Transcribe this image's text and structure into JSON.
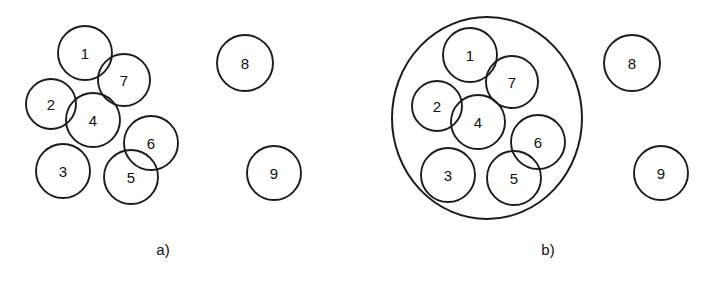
{
  "figure": {
    "width": 719,
    "height": 288,
    "background": "#ffffff",
    "stroke_color": "#1c1c1c",
    "label_color": "#111111"
  },
  "panels": [
    {
      "id": "panel-a",
      "caption": "a)",
      "caption_x": 163,
      "caption_y": 255,
      "hull": null,
      "circles": [
        {
          "label": "1",
          "cx": 85,
          "cy": 53,
          "r": 27
        },
        {
          "label": "7",
          "cx": 124,
          "cy": 80,
          "r": 26
        },
        {
          "label": "2",
          "cx": 51,
          "cy": 104,
          "r": 25
        },
        {
          "label": "4",
          "cx": 93,
          "cy": 120,
          "r": 27
        },
        {
          "label": "6",
          "cx": 151,
          "cy": 143,
          "r": 27
        },
        {
          "label": "3",
          "cx": 63,
          "cy": 171,
          "r": 27
        },
        {
          "label": "5",
          "cx": 131,
          "cy": 177,
          "r": 27
        },
        {
          "label": "8",
          "cx": 245,
          "cy": 63,
          "r": 28
        },
        {
          "label": "9",
          "cx": 274,
          "cy": 173,
          "r": 27
        }
      ]
    },
    {
      "id": "panel-b",
      "caption": "b)",
      "caption_x": 548,
      "caption_y": 255,
      "hull": {
        "cx": 487,
        "cy": 118,
        "rx": 95,
        "ry": 101
      },
      "circles": [
        {
          "label": "1",
          "cx": 470,
          "cy": 55,
          "r": 27
        },
        {
          "label": "7",
          "cx": 512,
          "cy": 82,
          "r": 26
        },
        {
          "label": "2",
          "cx": 437,
          "cy": 106,
          "r": 25
        },
        {
          "label": "4",
          "cx": 478,
          "cy": 122,
          "r": 27
        },
        {
          "label": "6",
          "cx": 538,
          "cy": 142,
          "r": 27
        },
        {
          "label": "3",
          "cx": 448,
          "cy": 175,
          "r": 27
        },
        {
          "label": "5",
          "cx": 514,
          "cy": 178,
          "r": 27
        },
        {
          "label": "8",
          "cx": 632,
          "cy": 63,
          "r": 28
        },
        {
          "label": "9",
          "cx": 661,
          "cy": 173,
          "r": 27
        }
      ]
    }
  ]
}
